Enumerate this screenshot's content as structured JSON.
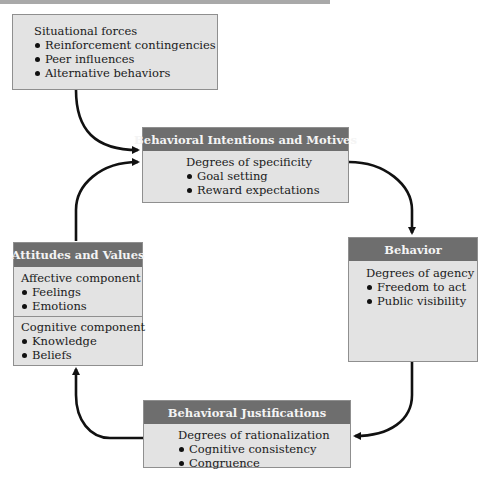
{
  "diagram": {
    "situational": {
      "title": "Situational forces",
      "items": [
        "Reinforcement contingencies",
        "Peer influences",
        "Alternative behaviors"
      ]
    },
    "intentions": {
      "header": "Behavioral Intentions and Motives",
      "subtitle": "Degrees of specificity",
      "items": [
        "Goal setting",
        "Reward expectations"
      ]
    },
    "behavior": {
      "header": "Behavior",
      "subtitle": "Degrees of agency",
      "items": [
        "Freedom to act",
        "Public visibility"
      ]
    },
    "justifications": {
      "header": "Behavioral Justifications",
      "subtitle": "Degrees of rationalization",
      "items": [
        "Cognitive consistency",
        "Congruence"
      ]
    },
    "attitudes": {
      "header": "Attitudes and Values",
      "affective": {
        "title": "Affective component",
        "items": [
          "Feelings",
          "Emotions"
        ]
      },
      "cognitive": {
        "title": "Cognitive component",
        "items": [
          "Knowledge",
          "Beliefs"
        ]
      }
    },
    "colors": {
      "box_fill": "#e3e3e3",
      "header_fill": "#6e6e6e",
      "header_text": "#f4f4f4",
      "arrow": "#111111"
    }
  }
}
